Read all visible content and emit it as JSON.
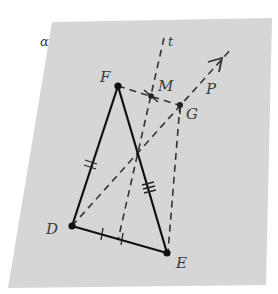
{
  "figure": {
    "plane": {
      "label": "α",
      "fill": "#d6d6d6",
      "corners": [
        [
          52,
          22
        ],
        [
          272,
          18
        ],
        [
          266,
          285
        ],
        [
          8,
          288
        ]
      ],
      "label_pos": [
        40,
        46
      ]
    },
    "points": [
      {
        "id": "F",
        "label": "F",
        "x": 118,
        "y": 86,
        "label_x": 100,
        "label_y": 82
      },
      {
        "id": "D",
        "label": "D",
        "x": 72,
        "y": 226,
        "label_x": 46,
        "label_y": 234
      },
      {
        "id": "E",
        "label": "E",
        "x": 167,
        "y": 253,
        "label_x": 176,
        "label_y": 268
      },
      {
        "id": "M",
        "label": "M",
        "x": 151,
        "y": 96,
        "label_x": 158,
        "label_y": 91
      },
      {
        "id": "G",
        "label": "G",
        "x": 180,
        "y": 105,
        "label_x": 186,
        "label_y": 119
      }
    ],
    "line_labels": [
      {
        "id": "t",
        "label": "t",
        "x": 168,
        "y": 46
      },
      {
        "id": "P",
        "label": "P",
        "x": 206,
        "y": 94
      }
    ],
    "triangle": {
      "vertices": [
        "D",
        "F",
        "E"
      ],
      "stroke": "#111111"
    },
    "dashed_lines": [
      {
        "name": "line-t",
        "x1": 164,
        "y1": 38,
        "x2": 118,
        "y2": 240
      },
      {
        "name": "segment-FG",
        "x1": 118,
        "y1": 86,
        "x2": 182,
        "y2": 106
      },
      {
        "name": "ray-DP",
        "x1": 72,
        "y1": 226,
        "x2": 232,
        "y2": 48
      },
      {
        "name": "segment-GE",
        "x1": 180,
        "y1": 105,
        "x2": 168,
        "y2": 252
      }
    ],
    "tick_marks": {
      "DF": 2,
      "FE": 3,
      "DE_halves": 1
    }
  }
}
